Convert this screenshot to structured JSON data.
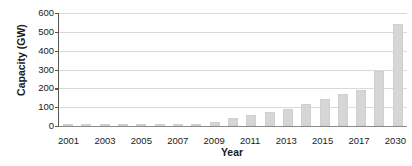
{
  "chart_data": {
    "type": "bar",
    "title": "",
    "xlabel": "Year",
    "ylabel": "Capacity (GW)",
    "ylim": [
      0,
      600
    ],
    "yticks": [
      0,
      100,
      200,
      300,
      400,
      500,
      600
    ],
    "ytick_labels": [
      "0",
      "100",
      "200",
      "300",
      "400",
      "500",
      "600"
    ],
    "grid": true,
    "legend": "none",
    "bar_color": "#d6d6d6",
    "categories": [
      "2001",
      "2002",
      "2003",
      "2004",
      "2005",
      "2006",
      "2007",
      "2008",
      "2009",
      "2010",
      "2011",
      "2012",
      "2013",
      "2014",
      "2015",
      "2016",
      "2017",
      "2018",
      "2030"
    ],
    "xtick_labels": [
      "2001",
      "",
      "2003",
      "",
      "2005",
      "",
      "2007",
      "",
      "2009",
      "",
      "2011",
      "",
      "2013",
      "",
      "2015",
      "",
      "2017",
      "",
      "2030"
    ],
    "values": [
      6,
      1,
      1,
      1,
      1,
      1,
      2,
      8,
      22,
      43,
      61,
      74,
      90,
      116,
      145,
      170,
      189,
      291,
      541
    ]
  },
  "axes": {
    "y_title": "Capacity (GW)",
    "x_title": "Year"
  }
}
